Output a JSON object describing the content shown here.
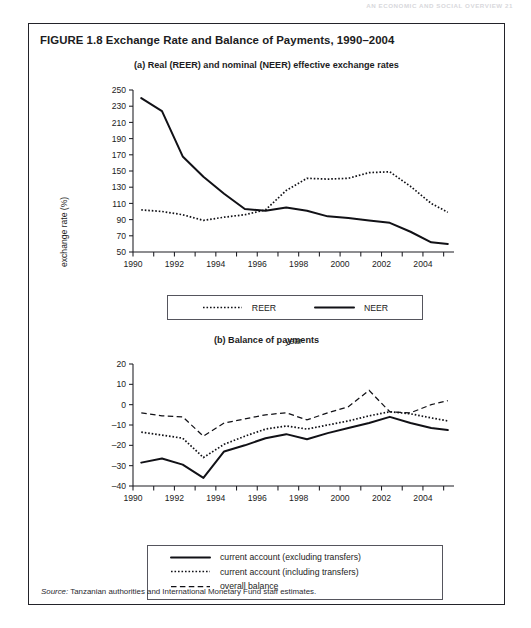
{
  "running_head": "AN ECONOMIC AND SOCIAL OVERVIEW    21",
  "figure": {
    "title": "FIGURE 1.8  Exchange Rate and Balance of Payments, 1990–2004",
    "source_prefix": "Source:",
    "source_text": " Tanzanian authorities and International Monetary Fund staff estimates."
  },
  "panel_a": {
    "subtitle": "(a) Real (REER) and nominal (NEER) effective exchange rates",
    "legend": [
      {
        "label": "REER",
        "style": "dotted"
      },
      {
        "label": "NEER",
        "style": "solid"
      }
    ]
  },
  "panel_b": {
    "subtitle": "(b) Balance of payments",
    "legend": [
      {
        "label": "current account (excluding transfers)",
        "style": "solid"
      },
      {
        "label": "current account (including transfers)",
        "style": "dotted"
      },
      {
        "label": "overall balance",
        "style": "dashed"
      }
    ]
  },
  "chart_data": [
    {
      "id": "panel-a",
      "type": "line",
      "title": "(a) Real (REER) and nominal (NEER) effective exchange rates",
      "xlabel": "year",
      "ylabel": "exchange rate (%)",
      "xlim": [
        1990,
        2005.5
      ],
      "ylim": [
        50,
        250
      ],
      "yticks": [
        50,
        70,
        90,
        110,
        130,
        150,
        170,
        190,
        210,
        230,
        250
      ],
      "ytick_labels": [
        "50",
        "70",
        "90",
        "110",
        "130",
        "150",
        "170",
        "190",
        "210",
        "230",
        "250"
      ],
      "xticks": [
        1990,
        1991,
        1992,
        1993,
        1994,
        1995,
        1996,
        1997,
        1998,
        1999,
        2000,
        2001,
        2002,
        2003,
        2004,
        2005
      ],
      "xtick_labels": [
        "1990",
        "",
        "1992",
        "",
        "1994",
        "",
        "1996",
        "",
        "1998",
        "",
        "2000",
        "",
        "2002",
        "",
        "2004",
        ""
      ],
      "grid": false,
      "legend_position": "below",
      "x": [
        1990.4,
        1991.4,
        1992.4,
        1993.4,
        1994.4,
        1995.4,
        1996.4,
        1997.4,
        1998.4,
        1999.4,
        2000.4,
        2001.4,
        2002.4,
        2003.4,
        2004.4,
        2005.2
      ],
      "series": [
        {
          "name": "NEER",
          "style": "solid",
          "values": [
            240,
            224,
            168,
            143,
            122,
            103,
            101,
            105,
            101,
            94,
            92,
            89,
            86,
            75,
            62,
            60
          ]
        },
        {
          "name": "REER",
          "style": "dotted",
          "values": [
            102,
            100,
            96,
            89,
            93,
            96,
            102,
            126,
            141,
            140,
            141,
            148,
            149,
            131,
            110,
            99
          ]
        }
      ]
    },
    {
      "id": "panel-b",
      "type": "line",
      "title": "(b) Balance of payments",
      "xlabel": "year",
      "ylabel": "% of GDP",
      "xlim": [
        1990,
        2005.5
      ],
      "ylim": [
        -40,
        20
      ],
      "yticks": [
        -40,
        -30,
        -20,
        -10,
        0,
        10,
        20
      ],
      "ytick_labels": [
        "–40",
        "–30",
        "–20",
        "–10",
        "0",
        "10",
        "20"
      ],
      "xticks": [
        1990,
        1991,
        1992,
        1993,
        1994,
        1995,
        1996,
        1997,
        1998,
        1999,
        2000,
        2001,
        2002,
        2003,
        2004,
        2005
      ],
      "xtick_labels": [
        "1990",
        "",
        "1992",
        "",
        "1994",
        "",
        "1996",
        "",
        "1998",
        "",
        "2000",
        "",
        "2002",
        "",
        "2004",
        ""
      ],
      "grid": false,
      "legend_position": "below",
      "x": [
        1990.4,
        1991.4,
        1992.4,
        1993.4,
        1994.4,
        1995.4,
        1996.4,
        1997.4,
        1998.4,
        1999.4,
        2000.4,
        2001.4,
        2002.4,
        2003.4,
        2004.4,
        2005.2
      ],
      "series": [
        {
          "name": "current account (excluding transfers)",
          "style": "solid",
          "values": [
            -28.5,
            -26.5,
            -29.5,
            -36,
            -23,
            -20,
            -16.5,
            -14.5,
            -17,
            -14,
            -11.5,
            -9,
            -6,
            -9,
            -11.5,
            -12.5
          ]
        },
        {
          "name": "current account (including transfers)",
          "style": "dotted",
          "values": [
            -13.5,
            -15,
            -16.5,
            -26,
            -19.5,
            -15.5,
            -12,
            -10.5,
            -12,
            -10,
            -8,
            -5.5,
            -3.5,
            -4.5,
            -6.5,
            -8
          ]
        },
        {
          "name": "overall balance",
          "style": "dashed",
          "values": [
            -4,
            -5.5,
            -6,
            -15.5,
            -9,
            -7,
            -5,
            -4,
            -7.5,
            -4,
            -1,
            7,
            -3.5,
            -4,
            0,
            2
          ]
        }
      ]
    }
  ]
}
